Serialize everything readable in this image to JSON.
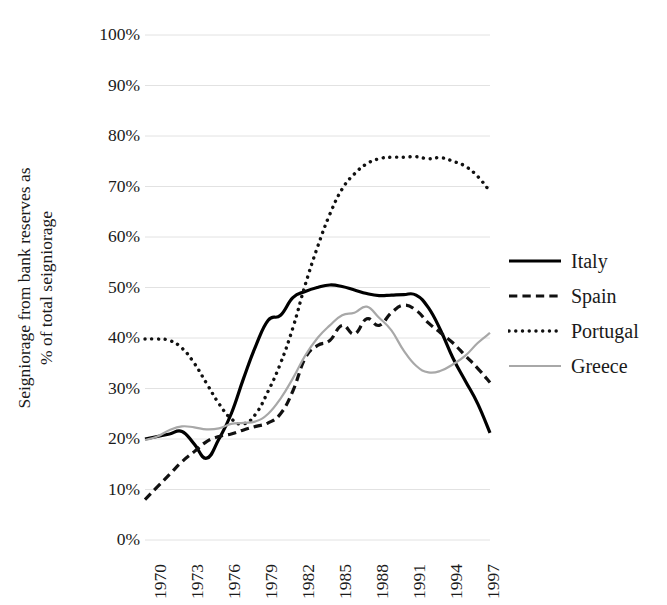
{
  "chart_data": {
    "type": "line",
    "title": "",
    "xlabel": "",
    "ylabel": "Seigniorage from bank reserves as % of total seigniorage",
    "ylabel_line1": "Seigniorage from bank reserves as",
    "ylabel_line2": "% of total seigniorage",
    "grid": true,
    "legend_position": "right",
    "xlim": [
      1970,
      1998
    ],
    "ylim": [
      0,
      100
    ],
    "ytick_labels": [
      "100%",
      "90%",
      "80%",
      "70%",
      "60%",
      "50%",
      "40%",
      "30%",
      "20%",
      "10%",
      "0%"
    ],
    "ytick_values": [
      100,
      90,
      80,
      70,
      60,
      50,
      40,
      30,
      20,
      10,
      0
    ],
    "xtick_labels": [
      "1970",
      "1973",
      "1976",
      "1979",
      "1982",
      "1985",
      "1988",
      "1991",
      "1994",
      "1997"
    ],
    "xtick_values": [
      1970,
      1973,
      1976,
      1979,
      1982,
      1985,
      1988,
      1991,
      1994,
      1997
    ],
    "x": [
      1970,
      1971,
      1972,
      1973,
      1974,
      1975,
      1976,
      1977,
      1978,
      1979,
      1980,
      1981,
      1982,
      1983,
      1984,
      1985,
      1986,
      1987,
      1988,
      1989,
      1990,
      1991,
      1992,
      1993,
      1994,
      1995,
      1996,
      1997,
      1998
    ],
    "series": [
      {
        "name": "Italy",
        "style": "solid",
        "color": "#000000",
        "width": 3.2,
        "values": [
          20.0,
          20.5,
          21.0,
          21.5,
          19.0,
          16.2,
          20.0,
          25.0,
          32.0,
          38.5,
          43.5,
          44.5,
          48.0,
          49.2,
          50.0,
          50.5,
          50.2,
          49.5,
          48.8,
          48.4,
          48.5,
          48.6,
          48.5,
          46.0,
          41.5,
          36.0,
          31.5,
          27.0,
          21.2
        ]
      },
      {
        "name": "Spain",
        "style": "dashed",
        "color": "#111111",
        "width": 3.2,
        "values": [
          8.0,
          10.5,
          13.0,
          15.5,
          17.5,
          19.5,
          20.5,
          21.0,
          21.8,
          22.5,
          23.2,
          25.0,
          29.5,
          36.0,
          38.5,
          39.5,
          42.5,
          40.8,
          43.8,
          42.5,
          45.0,
          46.5,
          45.5,
          43.0,
          41.0,
          39.0,
          36.5,
          34.0,
          31.2
        ]
      },
      {
        "name": "Portugal",
        "style": "dotted",
        "color": "#111111",
        "width": 3.4,
        "values": [
          39.8,
          39.8,
          39.5,
          38.0,
          35.0,
          31.0,
          27.0,
          24.0,
          23.0,
          25.0,
          29.5,
          35.0,
          42.0,
          50.5,
          58.0,
          64.5,
          69.5,
          72.5,
          74.5,
          75.5,
          75.8,
          75.8,
          75.9,
          75.5,
          75.7,
          75.0,
          74.0,
          72.0,
          69.0
        ]
      },
      {
        "name": "Greece",
        "style": "thin-solid",
        "color": "#a8a8a8",
        "width": 2.2,
        "values": [
          19.8,
          20.5,
          21.8,
          22.5,
          22.3,
          21.9,
          22.1,
          23.0,
          23.2,
          23.5,
          25.0,
          28.0,
          32.0,
          36.5,
          40.0,
          42.5,
          44.5,
          45.0,
          46.2,
          44.0,
          41.5,
          37.5,
          34.5,
          33.2,
          33.5,
          34.8,
          36.5,
          39.0,
          41.0
        ]
      }
    ]
  },
  "legend": {
    "items": [
      {
        "label": "Italy",
        "style": "solid"
      },
      {
        "label": "Spain",
        "style": "dashed"
      },
      {
        "label": "Portugal",
        "style": "dotted"
      },
      {
        "label": "Greece",
        "style": "thin-solid"
      }
    ]
  },
  "colors": {
    "gridline": "#e2e2e2",
    "text": "#1a1a1a",
    "italy": "#000000",
    "spain": "#111111",
    "portugal": "#111111",
    "greece": "#a8a8a8",
    "background": "#ffffff"
  }
}
